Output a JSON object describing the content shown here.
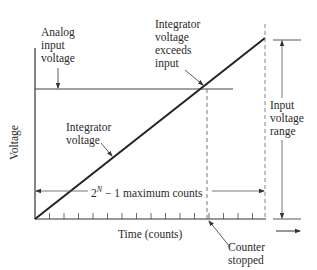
{
  "diagram": {
    "type": "dual-slope / counting ADC timing diagram",
    "axes": {
      "y_label": "Voltage",
      "x_label": "Time (counts)",
      "x_tick_count": 16
    },
    "labels": {
      "analog_input": [
        "Analog",
        "input",
        "voltage"
      ],
      "integrator_exceeds": [
        "Integrator",
        "voltage",
        "exceeds",
        "input"
      ],
      "integrator_voltage": [
        "Integrator",
        "voltage"
      ],
      "max_counts": {
        "base": "2",
        "exponent": "N",
        "rest": " − 1 maximum counts"
      },
      "input_range": [
        "Input",
        "voltage",
        "range"
      ],
      "counter_stopped": [
        "Counter",
        "stopped"
      ]
    },
    "colors": {
      "line": "#222222",
      "thin": "#555555",
      "dashed": "#666666",
      "text": "#2a2a2a"
    }
  }
}
